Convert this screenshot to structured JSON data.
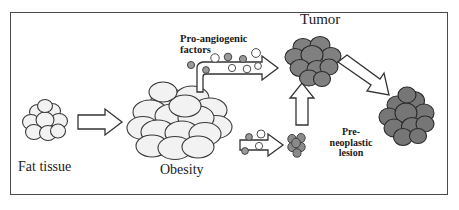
{
  "figure": {
    "frame": {
      "border_color": "#4a4a4a",
      "background": "#ffffff"
    }
  },
  "labels": {
    "fat_tissue": "Fat tissue",
    "obesity": "Obesity",
    "tumor": "Tumor",
    "pro_angiogenic_line1": "Pro-angiogenic",
    "pro_angiogenic_line2": "factors",
    "preneoplastic_line1": "Pre-",
    "preneoplastic_line2": "neoplastic",
    "preneoplastic_line3": "lesion"
  },
  "nodes": [
    {
      "id": "fat-tissue-cluster",
      "label": "Fat tissue",
      "kind": "cell-cluster",
      "fill": "#f2f2f2",
      "stroke": "#3a3a3a",
      "cell_count": 9,
      "size": "small"
    },
    {
      "id": "obesity-cluster",
      "label": "Obesity",
      "kind": "cell-cluster",
      "fill": "#f2f2f2",
      "stroke": "#3a3a3a",
      "cell_count": 16,
      "size": "large"
    },
    {
      "id": "preneoplastic-lesion-cluster",
      "label": "Pre-neoplastic lesion",
      "kind": "cell-cluster",
      "fill": "#8a8a8a",
      "stroke": "#3a3a3a",
      "cell_count": 6,
      "size": "tiny"
    },
    {
      "id": "tumor-cluster",
      "label": "Tumor",
      "kind": "cell-cluster",
      "fill": "#808080",
      "stroke": "#2a2a2a",
      "cell_count": 10,
      "size": "medium"
    },
    {
      "id": "metastasis-cluster",
      "label": "Metastatic tumor",
      "kind": "cell-cluster",
      "fill": "#7d7d7d",
      "stroke": "#2a2a2a",
      "cell_count": 11,
      "size": "medium"
    }
  ],
  "arrows": [
    {
      "id": "arrow-fat-to-obesity",
      "direction": "right",
      "style": "hollow-block"
    },
    {
      "id": "arrow-angiogenic-factors",
      "direction": "bent-up-right",
      "style": "hollow-block"
    },
    {
      "id": "arrow-growth-to-lesion",
      "direction": "right",
      "style": "hollow-block-small"
    },
    {
      "id": "arrow-lesion-to-tumor",
      "direction": "up",
      "style": "hollow-block"
    },
    {
      "id": "arrow-tumor-to-metastasis",
      "direction": "down-right-diagonal",
      "style": "hollow-block"
    }
  ],
  "factor_particles": {
    "description": "Secreted pro-angiogenic factor molecules along the bent arrow",
    "gray_fill": "#9a9a9a",
    "white_fill": "#ffffff",
    "stroke": "#3a3a3a",
    "count": 9
  },
  "colors": {
    "pale_cell": "#f2f2f2",
    "dark_cell": "#808080",
    "outline": "#3a3a3a",
    "frame": "#4a4a4a",
    "text": "#1a1a1a"
  }
}
